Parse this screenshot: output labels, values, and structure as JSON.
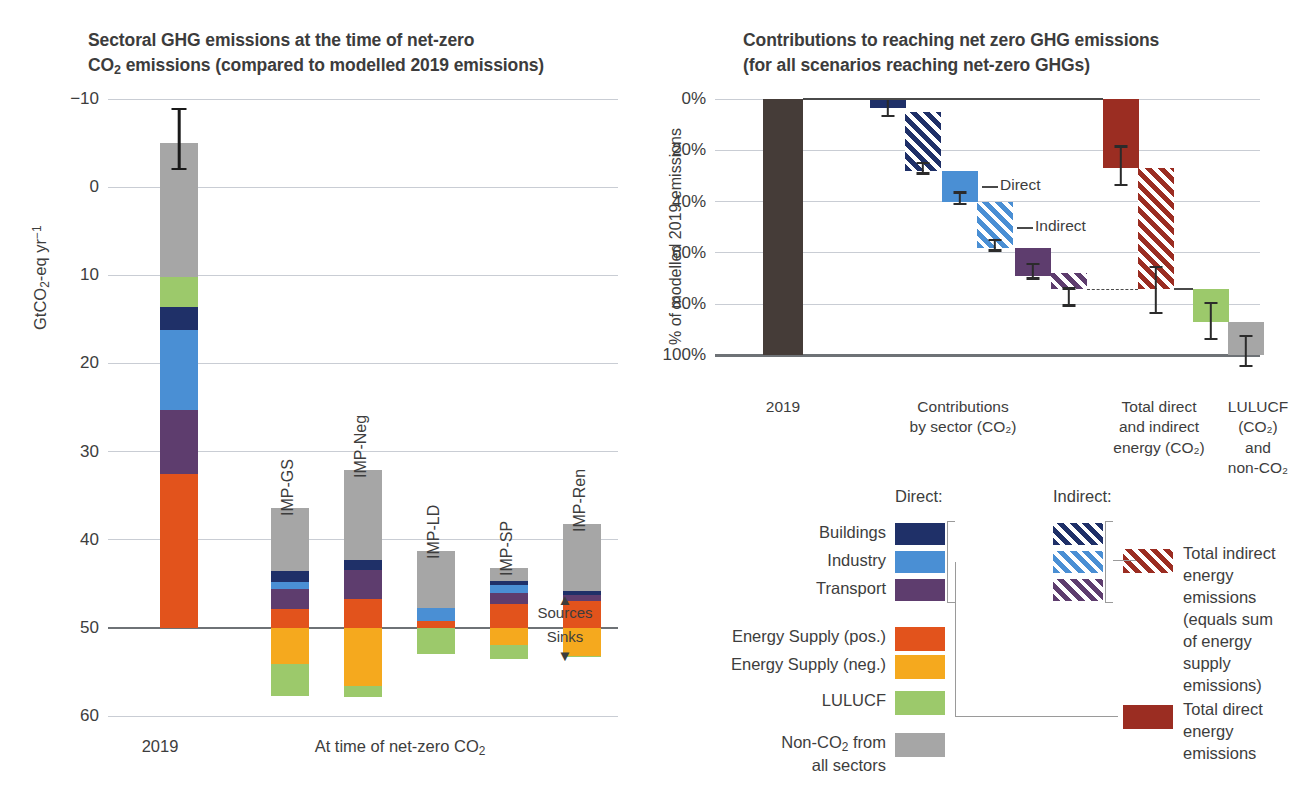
{
  "figure": {
    "panel_e": {
      "label": "(e)",
      "title_line1": "Sectoral GHG emissions at the time of net-zero",
      "title_line2_pre": "CO",
      "title_line2_sub": "2",
      "title_line2_post": " emissions (compared to modelled 2019 emissions)",
      "ylabel_pre": "GtCO",
      "ylabel_sub": "2",
      "ylabel_post": "-eq yr",
      "ylabel_sup": "−1",
      "yticks": [
        "60",
        "50",
        "40",
        "30",
        "20",
        "10",
        "0",
        "−10"
      ],
      "ytick_values": [
        60,
        50,
        40,
        30,
        20,
        10,
        0,
        -10
      ],
      "ylim": [
        -10,
        60
      ],
      "xcat_2019": "2019",
      "xcat_netzero_pre": "At time of net-zero CO",
      "xcat_netzero_sub": "2",
      "sources_label": "Sources",
      "sinks_label": "Sinks",
      "sources_arrow": "▲",
      "sinks_arrow": "▼"
    },
    "panel_f": {
      "label": "(f)",
      "title_line1": "Contributions to reaching net zero GHG emissions",
      "title_line2": "(for all scenarios reaching net-zero GHGs)",
      "ylabel": "% of modelled 2019 emissions",
      "yticks": [
        "100%",
        "80%",
        "60%",
        "40%",
        "20%",
        "0%"
      ],
      "ytick_values": [
        100,
        80,
        60,
        40,
        20,
        0
      ],
      "ylim": [
        -10,
        100
      ],
      "annotation_direct": "Direct",
      "annotation_indirect": "Indirect",
      "xcats": [
        {
          "lines": [
            "2019"
          ]
        },
        {
          "lines": [
            "Contributions",
            "by sector (CO₂)"
          ]
        },
        {
          "lines": [
            "Total direct",
            "and indirect",
            "energy (CO₂)"
          ]
        },
        {
          "lines": [
            "LULUCF (CO₂)",
            "and non-CO₂"
          ]
        }
      ]
    },
    "legend": {
      "head_direct": "Direct:",
      "head_indirect": "Indirect:",
      "sector_rows": [
        {
          "label": "Buildings",
          "color": "#1f3068"
        },
        {
          "label": "Industry",
          "color": "#4a8fd4"
        },
        {
          "label": "Transport",
          "color": "#5e3d6e"
        }
      ],
      "other_rows": [
        {
          "label": "Energy Supply (pos.)",
          "color": "#e2531c"
        },
        {
          "label": "Energy Supply (neg.)",
          "color": "#f5a91e"
        },
        {
          "label": "LULUCF",
          "color": "#9cc96b"
        }
      ],
      "noncoTwo_line1_pre": "Non-CO",
      "noncoTwo_line1_sub": "2",
      "noncoTwo_line1_post": " from",
      "noncoTwo_line2": "all sectors",
      "noncoTwo_color": "#a6a6a6",
      "total_indirect_lines": [
        "Total indirect",
        "energy emissions",
        "(equals sum",
        "of energy supply",
        "emissions)"
      ],
      "total_direct_lines": [
        "Total direct",
        "energy emissions"
      ],
      "total_color": "#9b2d22"
    }
  },
  "colors": {
    "buildings": "#1f3068",
    "industry": "#4a8fd4",
    "transport": "#5e3d6e",
    "energy_pos": "#e2531c",
    "energy_neg": "#f5a91e",
    "lulucf": "#9cc96b",
    "nonco2": "#a6a6a6",
    "total_energy": "#9b2d22",
    "bar2019_f": "#453c38",
    "axis": "#6e7276",
    "grid": "#c9cdd4",
    "text": "#3d3d3d"
  },
  "chart_data": [
    {
      "type": "bar",
      "id": "panel-e",
      "title": "(e) Sectoral GHG emissions at the time of net-zero CO2 emissions (compared to modelled 2019 emissions)",
      "xlabel": "",
      "ylabel": "GtCO2-eq yr-1",
      "ylim": [
        -10,
        60
      ],
      "yticks": [
        -10,
        0,
        10,
        20,
        30,
        40,
        50,
        60
      ],
      "grid": true,
      "stacked": true,
      "units": "GtCO2-eq yr-1",
      "categories": [
        "2019",
        "IMP-GS",
        "IMP-Neg",
        "IMP-LD",
        "IMP-SP",
        "IMP-Ren"
      ],
      "series": [
        {
          "name": "Energy Supply (pos.)",
          "color": "#e2531c",
          "values": [
            17.5,
            2.1,
            3.3,
            0.8,
            2.7,
            3.1
          ]
        },
        {
          "name": "Transport",
          "color": "#5e3d6e",
          "values": [
            7.2,
            2.3,
            3.3,
            0.0,
            1.3,
            0.6
          ]
        },
        {
          "name": "Industry",
          "color": "#4a8fd4",
          "values": [
            9.1,
            0.8,
            0.0,
            1.5,
            0.9,
            0.0
          ]
        },
        {
          "name": "Buildings",
          "color": "#1f3068",
          "values": [
            2.6,
            1.2,
            1.1,
            0.0,
            0.4,
            0.5
          ]
        },
        {
          "name": "LULUCF (pos.)",
          "color": "#9cc96b",
          "values": [
            3.4,
            0.0,
            0.0,
            0.0,
            0.0,
            0.0
          ]
        },
        {
          "name": "Non-CO2 from all sectors",
          "color": "#a6a6a6",
          "values": [
            15.2,
            7.2,
            10.2,
            6.4,
            1.5,
            7.6
          ]
        },
        {
          "name": "Energy Supply (neg.)",
          "color": "#f5a91e",
          "values": [
            0.0,
            -4.1,
            -6.6,
            0.0,
            -2.0,
            -3.2
          ]
        },
        {
          "name": "LULUCF (neg.)",
          "color": "#9cc96b",
          "values": [
            0.0,
            -3.6,
            -1.3,
            -3.0,
            -1.5,
            -0.1
          ]
        }
      ],
      "totals_gross_positive": [
        55.0,
        13.6,
        17.9,
        8.7,
        6.8,
        11.8
      ],
      "totals_negative": [
        0.0,
        -7.7,
        -7.9,
        -3.0,
        -3.5,
        -3.3
      ],
      "error_bars": [
        {
          "category": "2019",
          "low": 51.9,
          "high": 59.0
        }
      ]
    },
    {
      "type": "waterfall",
      "id": "panel-f",
      "title": "(f) Contributions to reaching net zero GHG emissions (for all scenarios reaching net-zero GHGs)",
      "xlabel": "",
      "ylabel": "% of modelled 2019 emissions",
      "ylim": [
        -10,
        100
      ],
      "yticks": [
        0,
        20,
        40,
        60,
        80,
        100
      ],
      "grid": true,
      "units": "% of modelled 2019 emissions",
      "steps": [
        {
          "name": "2019",
          "kind": "total",
          "color": "#453c38",
          "hatch": false,
          "top": 100,
          "bottom": 0,
          "group": "2019"
        },
        {
          "name": "Buildings direct",
          "kind": "step",
          "color": "#1f3068",
          "hatch": false,
          "top": 100,
          "bottom": 96.5,
          "err_low": 93.0,
          "err_high": 100.5,
          "group": "sector"
        },
        {
          "name": "Buildings indirect",
          "kind": "step",
          "color": "#1f3068",
          "hatch": true,
          "top": 95.0,
          "bottom": 72.0,
          "err_low": 70.5,
          "err_high": 75.5,
          "group": "sector"
        },
        {
          "name": "Industry direct",
          "kind": "step",
          "color": "#4a8fd4",
          "hatch": false,
          "top": 72.0,
          "bottom": 60.0,
          "err_low": 58.5,
          "err_high": 64.0,
          "group": "sector"
        },
        {
          "name": "Industry indirect",
          "kind": "step",
          "color": "#4a8fd4",
          "hatch": true,
          "top": 60.0,
          "bottom": 42.0,
          "err_low": 40.5,
          "err_high": 45.5,
          "group": "sector"
        },
        {
          "name": "Transport direct",
          "kind": "step",
          "color": "#5e3d6e",
          "hatch": false,
          "top": 42.0,
          "bottom": 31.0,
          "err_low": 29.5,
          "err_high": 36.0,
          "group": "sector"
        },
        {
          "name": "Transport indirect",
          "kind": "step",
          "color": "#5e3d6e",
          "hatch": true,
          "top": 32.0,
          "bottom": 26.0,
          "err_low": 19.0,
          "err_high": 26.5,
          "group": "sector"
        },
        {
          "name": "Total direct energy",
          "kind": "step",
          "color": "#9b2d22",
          "hatch": false,
          "top": 100,
          "bottom": 73.0,
          "err_low": 66.0,
          "err_high": 82.0,
          "group": "energy"
        },
        {
          "name": "Total indirect energy",
          "kind": "step",
          "color": "#9b2d22",
          "hatch": true,
          "top": 73.0,
          "bottom": 26.0,
          "err_low": 16.0,
          "err_high": 35.0,
          "group": "energy"
        },
        {
          "name": "LULUCF (CO2)",
          "kind": "step",
          "color": "#9cc96b",
          "hatch": false,
          "top": 26.0,
          "bottom": 13.0,
          "err_low": 6.0,
          "err_high": 21.0,
          "group": "lulucf"
        },
        {
          "name": "non-CO2",
          "kind": "step",
          "color": "#a6a6a6",
          "hatch": false,
          "top": 13.0,
          "bottom": 0.0,
          "err_low": -4.5,
          "err_high": 8.0,
          "group": "lulucf"
        }
      ],
      "annotations": [
        {
          "text": "Direct",
          "refers_to": "Industry direct"
        },
        {
          "text": "Indirect",
          "refers_to": "Industry indirect"
        }
      ]
    }
  ]
}
